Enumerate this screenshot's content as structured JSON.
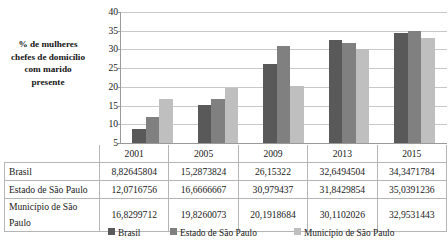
{
  "chart_data": {
    "type": "bar",
    "title": "",
    "subtitle": "",
    "xlabel": "",
    "ylabel": "% de mulheres chefes de domicílio com marido presente",
    "categories": [
      "2001",
      "2005",
      "2009",
      "2013",
      "2015"
    ],
    "ylim": [
      5,
      40
    ],
    "yticks": [
      5,
      10,
      15,
      20,
      25,
      30,
      35,
      40
    ],
    "grid": true,
    "legend_position": "bottom",
    "series": [
      {
        "name": "Brasil",
        "color": "#595959",
        "values": [
          8.82645804,
          15.2873824,
          26.15322,
          32.6494504,
          34.3471784
        ],
        "labels": [
          "8,82645804",
          "15,2873824",
          "26,15322",
          "32,6494504",
          "34,3471784"
        ]
      },
      {
        "name": "Estado de São Paulo",
        "color": "#808080",
        "values": [
          12.0716756,
          16.6666667,
          30.979437,
          31.8429854,
          35.0391236
        ],
        "labels": [
          "12,0716756",
          "16,6666667",
          "30,979437",
          "31,8429854",
          "35,0391236"
        ]
      },
      {
        "name": "Município de São Paulo",
        "color": "#bfbfbf",
        "values": [
          16.8299712,
          19.8260073,
          20.1918684,
          30.1102026,
          32.9531443
        ],
        "labels": [
          "16,8299712",
          "19,8260073",
          "20,1918684",
          "30,1102026",
          "32,9531443"
        ]
      }
    ]
  },
  "axis_title": {
    "line1": "% de mulheres",
    "line2": "chefes de domicílio",
    "line3": "com marido",
    "line4": "presente"
  },
  "yticks": {
    "t40": "40",
    "t35": "35",
    "t30": "30",
    "t25": "25",
    "t20": "20",
    "t15": "15",
    "t10": "10",
    "t5": "5"
  },
  "table": {
    "corner": "",
    "headers": [
      "2001",
      "2005",
      "2009",
      "2013",
      "2015"
    ],
    "rows": [
      {
        "label": "Brasil",
        "cells": [
          "8,82645804",
          "15,2873824",
          "26,15322",
          "32,6494504",
          "34,3471784"
        ]
      },
      {
        "label": "Estado de São Paulo",
        "cells": [
          "12,0716756",
          "16,6666667",
          "30,979437",
          "31,8429854",
          "35,0391236"
        ]
      },
      {
        "label": "Município de São Paulo",
        "cells": [
          "16,8299712",
          "19,8260073",
          "20,1918684",
          "30,1102026",
          "32,9531443"
        ]
      }
    ]
  },
  "legend": {
    "items": [
      {
        "label": "Brasil",
        "color": "#595959"
      },
      {
        "label": "Estado de São Paulo",
        "color": "#808080"
      },
      {
        "label": "Município de São Paulo",
        "color": "#bfbfbf"
      }
    ]
  }
}
